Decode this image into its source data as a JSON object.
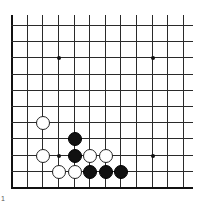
{
  "board": {
    "columns": 12,
    "rows": 11,
    "origin_x": 11,
    "origin_y": 25,
    "spacing_x": 15.64,
    "spacing_y": 16.2,
    "right_extent_x": 193,
    "top_extent_y": 15,
    "edges": [
      "left",
      "bottom"
    ],
    "line_color": "#2a2a2a"
  },
  "star_points": [
    {
      "col": 3,
      "row": 2
    },
    {
      "col": 9,
      "row": 2
    },
    {
      "col": 3,
      "row": 8
    },
    {
      "col": 9,
      "row": 8
    }
  ],
  "stones": [
    {
      "color": "white",
      "col": 2,
      "row": 6
    },
    {
      "color": "black",
      "col": 4,
      "row": 7
    },
    {
      "color": "white",
      "col": 2,
      "row": 8
    },
    {
      "color": "black",
      "col": 4,
      "row": 8
    },
    {
      "color": "white",
      "col": 5,
      "row": 8
    },
    {
      "color": "white",
      "col": 6,
      "row": 8
    },
    {
      "color": "white",
      "col": 3,
      "row": 9
    },
    {
      "color": "white",
      "col": 4,
      "row": 9
    },
    {
      "color": "black",
      "col": 5,
      "row": 9
    },
    {
      "color": "black",
      "col": 6,
      "row": 9
    },
    {
      "color": "black",
      "col": 7,
      "row": 9
    }
  ],
  "corner_mark": "1"
}
